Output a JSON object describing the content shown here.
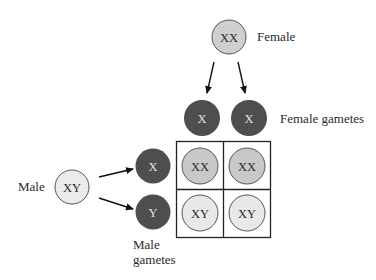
{
  "diagram": {
    "type": "punnett-square",
    "colors": {
      "parent_female_fill": "#cfcfcf",
      "parent_male_fill": "#ebebeb",
      "gamete_fill": "#4e4e4e",
      "gamete_text": "#e6e6e6",
      "offspring_xx_fill": "#c8c8c8",
      "offspring_xy_fill": "#e8e8e8",
      "outline": "#555555",
      "grid_line": "#222222",
      "text": "#2a2a2a"
    },
    "female": {
      "genotype": "XX",
      "label": "Female"
    },
    "male": {
      "genotype": "XY",
      "label": "Male"
    },
    "female_gametes": {
      "label": "Female gametes",
      "items": [
        {
          "allele": "X"
        },
        {
          "allele": "X"
        }
      ]
    },
    "male_gametes": {
      "label_line1": "Male",
      "label_line2": "gametes",
      "items": [
        {
          "allele": "X"
        },
        {
          "allele": "Y"
        }
      ]
    },
    "grid": {
      "rows": [
        [
          {
            "genotype": "XX"
          },
          {
            "genotype": "XX"
          }
        ],
        [
          {
            "genotype": "XY"
          },
          {
            "genotype": "XY"
          }
        ]
      ]
    }
  }
}
